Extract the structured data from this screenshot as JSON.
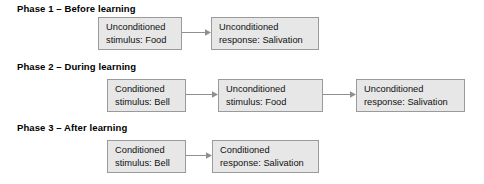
{
  "diagram": {
    "colors": {
      "box_fill": "#e7e7e7",
      "box_border": "#9a9a9a",
      "arrow": "#8f8f8f",
      "text": "#111111",
      "background": "#ffffff"
    },
    "phases": [
      {
        "id": "phase-1",
        "title": "Phase 1 – Before learning",
        "nodes": [
          {
            "id": "p1-ucs",
            "line1": "Unconditioned",
            "line2": "stimulus: Food"
          },
          {
            "id": "p1-ucr",
            "line1": "Unconditioned",
            "line2": "response: Salivation"
          }
        ],
        "arrows": [
          {
            "id": "p1-arrow-1",
            "from": "p1-ucs",
            "to": "p1-ucr",
            "direction": "right"
          }
        ]
      },
      {
        "id": "phase-2",
        "title": "Phase 2 – During learning",
        "nodes": [
          {
            "id": "p2-cs",
            "line1": "Conditioned",
            "line2": "stimulus: Bell"
          },
          {
            "id": "p2-ucs",
            "line1": "Unconditioned",
            "line2": "stimulus: Food"
          },
          {
            "id": "p2-ucr",
            "line1": "Unconditioned",
            "line2": "response: Salivation"
          }
        ],
        "arrows": [
          {
            "id": "p2-arrow-1",
            "from": "p2-cs",
            "to": "p2-ucs",
            "direction": "right"
          },
          {
            "id": "p2-arrow-2",
            "from": "p2-ucs",
            "to": "p2-ucr",
            "direction": "right"
          }
        ]
      },
      {
        "id": "phase-3",
        "title": "Phase 3 – After learning",
        "nodes": [
          {
            "id": "p3-cs",
            "line1": "Conditioned",
            "line2": "stimulus: Bell"
          },
          {
            "id": "p3-cr",
            "line1": "Conditioned",
            "line2": "response: Salivation"
          }
        ],
        "arrows": [
          {
            "id": "p3-arrow-1",
            "from": "p3-cs",
            "to": "p3-cr",
            "direction": "right"
          }
        ]
      }
    ]
  }
}
